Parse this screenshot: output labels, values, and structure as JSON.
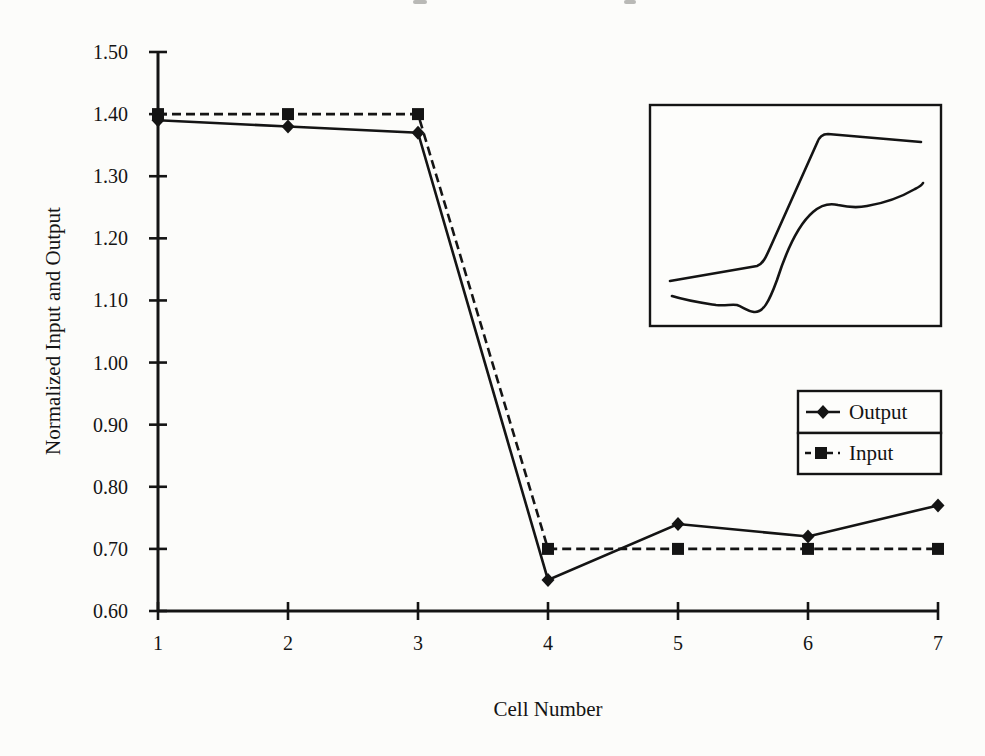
{
  "figure": {
    "background": "#fcfcfa",
    "ink": "#141414"
  },
  "chart_data": {
    "type": "line",
    "title": "",
    "xlabel": "Cell Number",
    "ylabel": "Normalized Input and Output",
    "categories": [
      1,
      2,
      3,
      4,
      5,
      6,
      7
    ],
    "x_tick_labels": [
      "1",
      "2",
      "3",
      "4",
      "5",
      "6",
      "7"
    ],
    "y_tick_labels": [
      "1.50",
      "1.40",
      "1.30",
      "1.20",
      "1.10",
      "1.00",
      "0.90",
      "0.80",
      "0.70",
      "0.60"
    ],
    "xlim": [
      1,
      7
    ],
    "ylim": [
      0.6,
      1.5
    ],
    "grid": false,
    "series": [
      {
        "name": "Output",
        "marker": "diamond",
        "line_style": "solid",
        "values": [
          1.39,
          1.38,
          1.37,
          0.65,
          0.74,
          0.72,
          0.77
        ]
      },
      {
        "name": "Input",
        "marker": "square",
        "line_style": "dashed",
        "values": [
          1.4,
          1.4,
          1.4,
          0.7,
          0.7,
          0.7,
          0.7
        ]
      }
    ],
    "legend": {
      "position": "right-middle",
      "entries": [
        "Output",
        "Input"
      ]
    },
    "inset": {
      "description": "unlabeled inset with two response traces",
      "box": [
        650,
        105,
        291,
        221
      ],
      "curves": [
        {
          "name": "upper-trace",
          "path": "M 670 281 L 757 266 C 763 264 766 257 770 248 L 817 143 C 819 137 822 134 828 134 L 921 142"
        },
        {
          "name": "lower-trace",
          "path": "M 672 296 C 688 301 703 303 716 305 C 726 306 731 304 737 305 C 743 307 747 311 754 312 C 763 313 769 302 777 280 C 786 252 799 224 813 212 C 821 205 830 203 838 205 C 847 207 857 208 867 206 C 885 203 903 196 915 189 C 919 187 922 185 923 183"
        }
      ]
    }
  }
}
